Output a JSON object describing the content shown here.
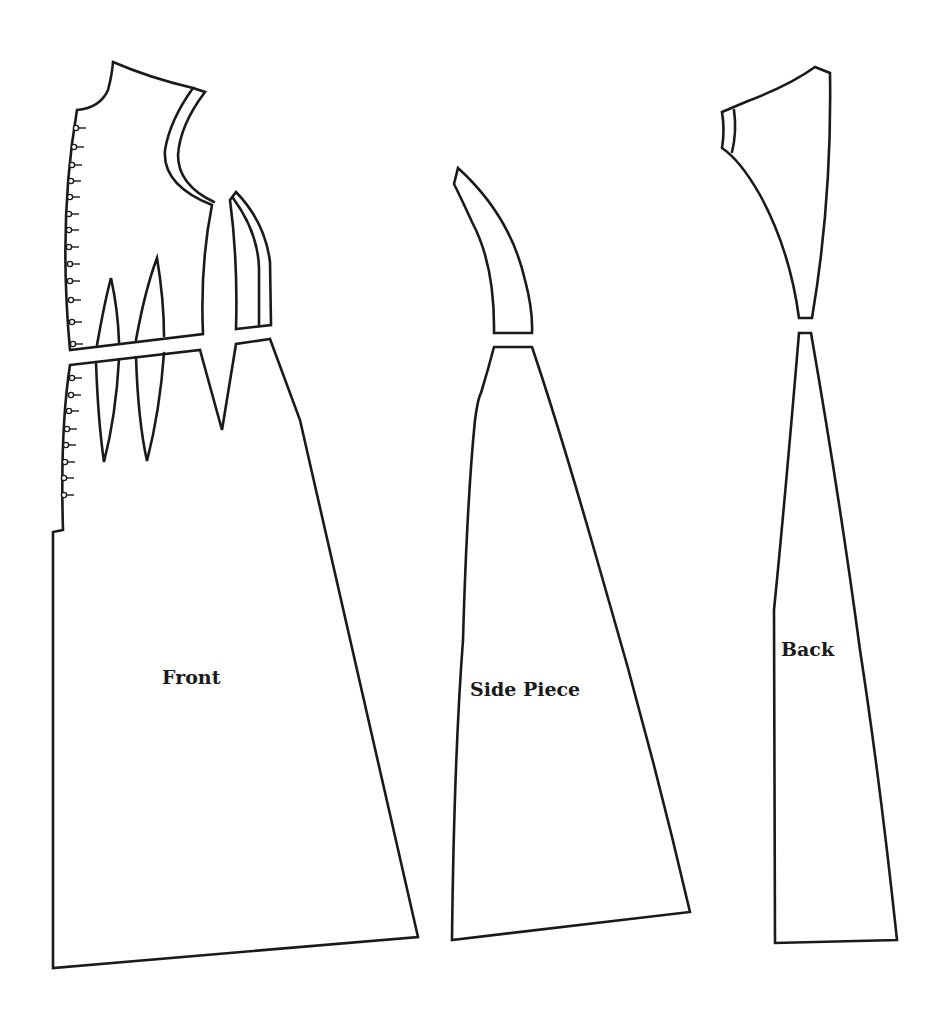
{
  "diagram": {
    "type": "sewing-pattern",
    "background": "#ffffff",
    "line_color": "#1a1a1a",
    "pieces": [
      {
        "id": "front",
        "label": "Front",
        "parts": [
          "bodice",
          "skirt",
          "shoulder-strap",
          "side-insert"
        ],
        "darts": 3,
        "button_loops_upper": 13,
        "button_loops_lower": 8
      },
      {
        "id": "side",
        "label": "Side Piece",
        "parts": [
          "upper",
          "lower"
        ]
      },
      {
        "id": "back",
        "label": "Back",
        "parts": [
          "upper",
          "lower"
        ]
      }
    ]
  },
  "labels": {
    "front": "Front",
    "side": "Side Piece",
    "back": "Back"
  }
}
